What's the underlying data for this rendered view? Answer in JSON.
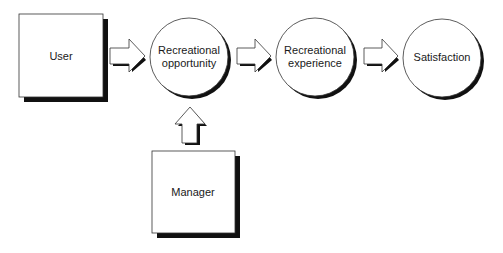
{
  "diagram": {
    "title": "",
    "nodes": [
      {
        "id": "user",
        "shape": "box",
        "lines": [
          "User"
        ]
      },
      {
        "id": "opportunity",
        "shape": "circle",
        "lines": [
          "Recreational",
          "opportunity"
        ]
      },
      {
        "id": "experience",
        "shape": "circle",
        "lines": [
          "Recreational",
          "experience"
        ]
      },
      {
        "id": "satisfaction",
        "shape": "circle",
        "lines": [
          "Satisfaction"
        ]
      },
      {
        "id": "manager",
        "shape": "box",
        "lines": [
          "Manager"
        ]
      }
    ],
    "edges": [
      {
        "from": "user",
        "to": "opportunity",
        "style": "block-arrow-right"
      },
      {
        "from": "opportunity",
        "to": "experience",
        "style": "block-arrow-right"
      },
      {
        "from": "experience",
        "to": "satisfaction",
        "style": "block-arrow-right"
      },
      {
        "from": "manager",
        "to": "opportunity",
        "style": "block-arrow-up"
      }
    ],
    "colors": {
      "stroke": "#333333",
      "fill": "#ffffff",
      "shadow": "#111111"
    }
  },
  "labels": {
    "user": "User",
    "opportunity_1": "Recreational",
    "opportunity_2": "opportunity",
    "experience_1": "Recreational",
    "experience_2": "experience",
    "satisfaction": "Satisfaction",
    "manager": "Manager"
  }
}
